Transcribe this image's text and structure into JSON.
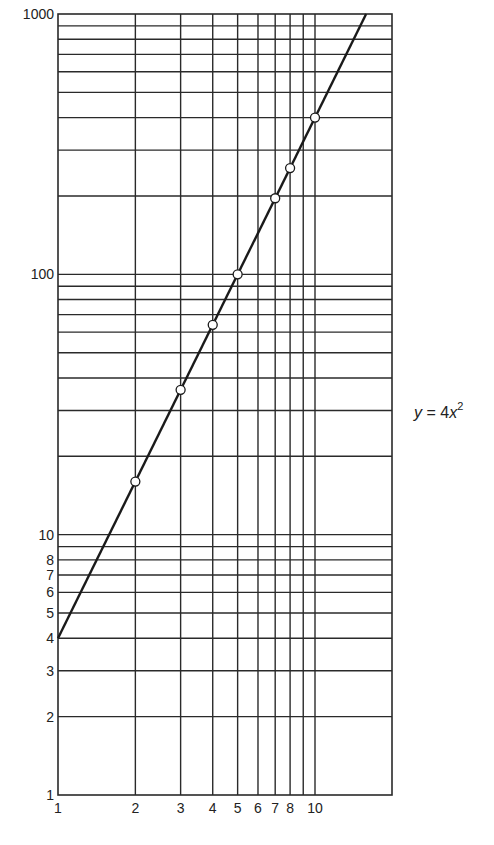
{
  "chart_data": {
    "type": "line",
    "title": "",
    "xlabel": "",
    "ylabel": "",
    "xscale": "log",
    "yscale": "log",
    "xlim": [
      1,
      20
    ],
    "ylim": [
      1,
      1000
    ],
    "grid": true,
    "legend": "none",
    "annotation": {
      "text_var": "y",
      "text_eq": " = 4",
      "text_x": "x",
      "text_exp": "2"
    },
    "x_tick_labels": [
      "1",
      "2",
      "3",
      "4",
      "5",
      "6",
      "7",
      "8",
      "10"
    ],
    "x_tick_values": [
      1,
      2,
      3,
      4,
      5,
      6,
      7,
      8,
      10
    ],
    "x_grid_values": [
      2,
      3,
      4,
      5,
      6,
      7,
      8,
      9,
      10
    ],
    "y_tick_labels": [
      "1",
      "2",
      "3",
      "4",
      "5",
      "6",
      "7",
      "8",
      "10",
      "100",
      "1000"
    ],
    "y_tick_values": [
      1,
      2,
      3,
      4,
      5,
      6,
      7,
      8,
      10,
      100,
      1000
    ],
    "y_grid_values": [
      2,
      3,
      4,
      5,
      6,
      7,
      8,
      9,
      10,
      20,
      30,
      40,
      50,
      60,
      70,
      80,
      90,
      100,
      200,
      300,
      400,
      500,
      600,
      700,
      800,
      900
    ],
    "series": [
      {
        "name": "y = 4x^2",
        "line": {
          "x": [
            1,
            15.81
          ],
          "y": [
            4,
            1000
          ]
        },
        "points": {
          "x": [
            2,
            3,
            4,
            5,
            7,
            8,
            10
          ],
          "y": [
            16,
            36,
            64,
            100,
            196,
            256,
            400
          ]
        },
        "color": "#1a1a1a"
      }
    ]
  },
  "colors": {
    "grid": "#2a2a2a",
    "line": "#1a1a1a",
    "marker_fill": "#ffffff"
  }
}
